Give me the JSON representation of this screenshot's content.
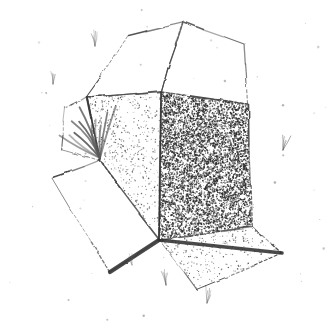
{
  "artwork": {
    "title": "Open Cardboard Box",
    "medium": "pen-and-ink stipple drawing",
    "subject": "an open-flapped cardboard box resting on ground with grass tufts",
    "background_color": "#ffffff",
    "ink_color": "#3a3a3a",
    "canvas": {
      "width": 334,
      "height": 329
    }
  },
  "palette": {
    "paper": "#ffffff",
    "outline": "#4a4a4a",
    "outline_soft": "#6e6e6e",
    "heavy_edge": "#333333",
    "stipple_dark": "#2b2b2b",
    "stipple_light": "#555555",
    "grass": "#5a5a5a",
    "speckle": "#8c8c8c"
  },
  "geometry": {
    "top_flap_left": {
      "name": "top-left-flap",
      "points": "87,97 128,36 183,22 161,92",
      "fill": "#ffffff",
      "shade": "none"
    },
    "top_flap_right": {
      "name": "top-right-flap",
      "points": "161,92 183,22 244,44 248,104",
      "fill": "#ffffff",
      "shade": "none"
    },
    "inner_face_left": {
      "name": "inner-left-face",
      "points": "87,97 161,92 159,240 100,160",
      "fill": "#ffffff",
      "shade": "light-stipple"
    },
    "inner_face_right": {
      "name": "inner-right-face",
      "points": "161,92 248,104 252,227 159,240",
      "fill": "#ffffff",
      "shade": "dark-stipple"
    },
    "bottom_flap_left": {
      "name": "bottom-left-flap",
      "points": "52,178 100,160 159,240 110,272",
      "fill": "#ffffff",
      "shade": "none"
    },
    "bottom_flap_right": {
      "name": "bottom-right-flap",
      "points": "159,240 252,227 282,253 197,290",
      "fill": "#ffffff",
      "shade": "light-stipple"
    },
    "back_flap_outline": {
      "name": "back-flap-outline",
      "points": "64,108 87,97 100,160 62,150",
      "fill": "none",
      "shade": "none"
    }
  },
  "shading": {
    "dark_face_density": 0.46,
    "light_face_density": 0.1,
    "bottom_right_density": 0.07,
    "speckle_count": 46
  },
  "grass_tufts": [
    {
      "name": "grass-tuft-main-left",
      "x": 100,
      "y": 158,
      "scale": 1.9,
      "blades": 11,
      "spread": 78,
      "tilt": -22
    },
    {
      "name": "grass-tuft-top",
      "x": 95,
      "y": 46,
      "scale": 0.55,
      "blades": 5,
      "spread": 26,
      "tilt": -4
    },
    {
      "name": "grass-tuft-upper-left",
      "x": 53,
      "y": 84,
      "scale": 0.5,
      "blades": 5,
      "spread": 24,
      "tilt": 2
    },
    {
      "name": "grass-tuft-right",
      "x": 283,
      "y": 150,
      "scale": 0.6,
      "blades": 5,
      "spread": 30,
      "tilt": 14
    },
    {
      "name": "grass-tuft-bottom",
      "x": 166,
      "y": 285,
      "scale": 0.55,
      "blades": 5,
      "spread": 26,
      "tilt": -6
    },
    {
      "name": "grass-tuft-bottom-low",
      "x": 207,
      "y": 303,
      "scale": 0.55,
      "blades": 5,
      "spread": 28,
      "tilt": 10
    },
    {
      "name": "grass-tuft-bottom-far",
      "x": 132,
      "y": 265,
      "scale": 0.4,
      "blades": 4,
      "spread": 20,
      "tilt": -10
    }
  ],
  "heavy_edges": [
    {
      "name": "edge-bottom-left-dark",
      "path": "M 110,272 L 159,240",
      "width": 4.2
    },
    {
      "name": "edge-bottom-right-dark",
      "path": "M 159,240 L 282,253",
      "width": 3.6
    },
    {
      "name": "edge-center-vertical",
      "path": "M 161,92 L 159,240",
      "width": 1.6
    },
    {
      "name": "edge-left-crease",
      "path": "M 87,97 L 100,160",
      "width": 1.6
    }
  ]
}
